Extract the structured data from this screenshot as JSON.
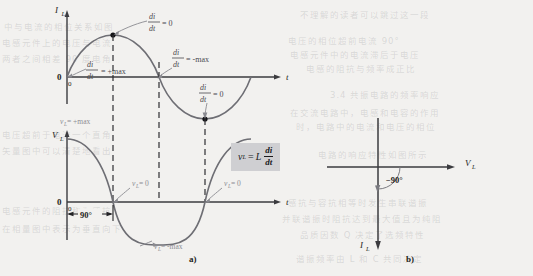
{
  "figure": {
    "panel_a": {
      "label": "a)",
      "top_chart": {
        "y_axis_label": "I",
        "y_axis_sub": "L",
        "x_axis_label": "t",
        "origin_label": "0",
        "origin_label_small": "0",
        "annotations": [
          {
            "id": "peak-zero-slope",
            "num": "di",
            "den": "dt",
            "rhs": "= 0"
          },
          {
            "id": "rise-max-slope",
            "num": "di",
            "den": "dt",
            "rhs": "= +max"
          },
          {
            "id": "fall-max-slope",
            "num": "di",
            "den": "dt",
            "rhs": "= -max"
          },
          {
            "id": "trough-zero-slope",
            "num": "di",
            "den": "dt",
            "rhs": "= 0"
          }
        ]
      },
      "bottom_chart": {
        "y_axis_label": "V",
        "y_axis_sub": "L",
        "x_axis_label": "t",
        "origin_label": "0",
        "origin_label_small": "0",
        "phase_label": "90°",
        "annotations": [
          {
            "id": "vl-pos-max",
            "text": "v",
            "sub": "L",
            "rhs": "= +max"
          },
          {
            "id": "vl-zero-first",
            "text": "v",
            "sub": "L",
            "rhs": "= 0"
          },
          {
            "id": "vl-zero-second",
            "text": "v",
            "sub": "L",
            "rhs": "= 0"
          },
          {
            "id": "vl-neg-max",
            "text": "v",
            "sub": "L",
            "rhs": "= -max"
          }
        ]
      },
      "formula": {
        "lhs": "v",
        "lhs_sub": "L",
        "equals": "=",
        "coefficient": "L",
        "numerator": "di",
        "denominator": "dt"
      }
    },
    "panel_b": {
      "label": "b)",
      "voltage_phasor_label": "V",
      "voltage_phasor_sub": "L",
      "current_phasor_label": "I",
      "current_phasor_sub": "L",
      "angle_label": "−90°"
    }
  },
  "chart_data": [
    {
      "type": "line",
      "id": "inductor-current-waveform",
      "title": "Inductor current I_L versus time",
      "xlabel": "t",
      "ylabel": "I_L",
      "ylim": [
        -1,
        1
      ],
      "xlim": [
        0,
        360
      ],
      "grid": false,
      "legend": "none",
      "series": [
        {
          "name": "i_L(t) = sin(t)",
          "x": [
            0,
            30,
            60,
            90,
            120,
            150,
            180,
            210,
            240,
            270,
            300,
            330,
            360
          ],
          "y": [
            0,
            0.5,
            0.87,
            1.0,
            0.87,
            0.5,
            0,
            -0.5,
            -0.87,
            -1.0,
            -0.87,
            -0.5,
            0
          ]
        }
      ],
      "markers": [
        {
          "x": 90,
          "y": 1.0,
          "label": "di/dt = 0"
        },
        {
          "x": 270,
          "y": -1.0,
          "label": "di/dt = 0"
        },
        {
          "x": 0,
          "y": 0,
          "label": "di/dt = +max"
        },
        {
          "x": 180,
          "y": 0,
          "label": "di/dt = -max"
        }
      ]
    },
    {
      "type": "line",
      "id": "inductor-voltage-waveform",
      "title": "Inductor voltage V_L versus time",
      "xlabel": "t",
      "ylabel": "V_L",
      "ylim": [
        -1,
        1
      ],
      "xlim": [
        0,
        360
      ],
      "grid": false,
      "legend": "none",
      "series": [
        {
          "name": "v_L(t) = cos(t)",
          "x": [
            0,
            30,
            60,
            90,
            120,
            150,
            180,
            210,
            240,
            270,
            300,
            330,
            360
          ],
          "y": [
            1.0,
            0.87,
            0.5,
            0,
            -0.5,
            -0.87,
            -1.0,
            -0.87,
            -0.5,
            0,
            0.5,
            0.87,
            1.0
          ]
        }
      ],
      "markers": [
        {
          "x": 0,
          "y": 1.0,
          "label": "v_L = +max"
        },
        {
          "x": 90,
          "y": 0,
          "label": "v_L = 0"
        },
        {
          "x": 180,
          "y": -1.0,
          "label": "v_L = -max"
        },
        {
          "x": 270,
          "y": 0,
          "label": "v_L = 0"
        }
      ],
      "annotations": [
        {
          "type": "dimension",
          "from_x": 0,
          "to_x": 90,
          "label": "90°"
        }
      ]
    },
    {
      "type": "scatter",
      "id": "phasor-diagram",
      "title": "Phasor diagram for an inductor",
      "xlabel": "",
      "ylabel": "",
      "vectors": [
        {
          "name": "V_L",
          "magnitude": 1.0,
          "angle_deg": 0
        },
        {
          "name": "I_L",
          "magnitude": 1.0,
          "angle_deg": -90
        }
      ],
      "annotations": [
        {
          "type": "arc",
          "label": "−90°",
          "from_deg": 0,
          "to_deg": -90
        }
      ]
    }
  ],
  "background_bleed": [
    {
      "id": "bleed-1",
      "text": "不理解的读者可以跳过这一段",
      "x": 300,
      "y": 8,
      "size": 8.5
    },
    {
      "id": "bleed-2",
      "text": "电压的相位超前电流 90°",
      "x": 288,
      "y": 34,
      "size": 8.5
    },
    {
      "id": "bleed-3",
      "text": "电感元件中的电流滞后于电压",
      "x": 290,
      "y": 48,
      "size": 8.5
    },
    {
      "id": "bleed-4",
      "text": "电感的阻抗与频率成正比",
      "x": 306,
      "y": 62,
      "size": 8.5
    },
    {
      "id": "bleed-5",
      "text": "3.4 共振电路的频率响应",
      "x": 330,
      "y": 88,
      "size": 8.5
    },
    {
      "id": "bleed-6",
      "text": "在交流电路中，电感和电容的作用",
      "x": 290,
      "y": 106,
      "size": 8.5
    },
    {
      "id": "bleed-7",
      "text": "时，电路中的电流和电压的相位",
      "x": 296,
      "y": 120,
      "size": 8.5
    },
    {
      "id": "bleed-8",
      "text": "电路的响应特性如图所示",
      "x": 318,
      "y": 148,
      "size": 8.5
    },
    {
      "id": "bleed-9",
      "text": "感抗与容抗相等时发生串联谐振",
      "x": 288,
      "y": 196,
      "size": 8.5
    },
    {
      "id": "bleed-10",
      "text": "并联谐振时阻抗达到最大值且为纯阻",
      "x": 282,
      "y": 212,
      "size": 8.5
    },
    {
      "id": "bleed-11",
      "text": "品质因数 Q 决定了选频特性",
      "x": 300,
      "y": 228,
      "size": 8.5
    },
    {
      "id": "bleed-12",
      "text": "谐振频率由 L 和 C 共同决定",
      "x": 296,
      "y": 252,
      "size": 8.5
    },
    {
      "id": "bleed-13",
      "text": "中与电流的相位关系如图",
      "x": 4,
      "y": 20,
      "size": 8.5
    },
    {
      "id": "bleed-14",
      "text": "电感元件上的电压与电流",
      "x": 2,
      "y": 36,
      "size": 8.5
    },
    {
      "id": "bleed-15",
      "text": "两者之间相差 90 度电角",
      "x": 2,
      "y": 52,
      "size": 8.5
    },
    {
      "id": "bleed-16",
      "text": "电压超前于电流一个直角",
      "x": 2,
      "y": 128,
      "size": 8.5
    },
    {
      "id": "bleed-17",
      "text": "矢量图中可以清楚地看出",
      "x": 2,
      "y": 144,
      "size": 8.5
    },
    {
      "id": "bleed-18",
      "text": "电感元件的阻抗称为感抗",
      "x": 2,
      "y": 204,
      "size": 8.5
    },
    {
      "id": "bleed-19",
      "text": "在相量图中表示为垂直向下",
      "x": 2,
      "y": 222,
      "size": 8.5
    }
  ]
}
